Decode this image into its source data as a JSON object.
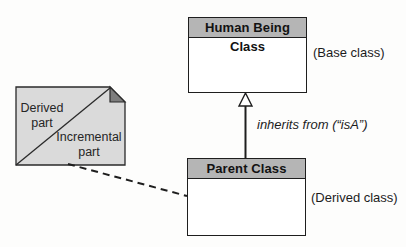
{
  "diagram": {
    "base_class": {
      "title": "Human Being Class",
      "annotation": "(Base class)"
    },
    "derived_class": {
      "title": "Parent Class",
      "annotation": "(Derived class)"
    },
    "inheritance_label": "inherits from (“isA”)",
    "note": {
      "derived_part_label": "Derived part",
      "incremental_part_label": "Incremental part"
    },
    "colors": {
      "class_header_fill": "#b5b5b5",
      "class_body_fill": "#ffffff",
      "note_fill": "#dadada",
      "note_fold_fill": "#7d7d7d",
      "line_color": "#1e1e1e",
      "background": "#fdfdfc"
    }
  }
}
